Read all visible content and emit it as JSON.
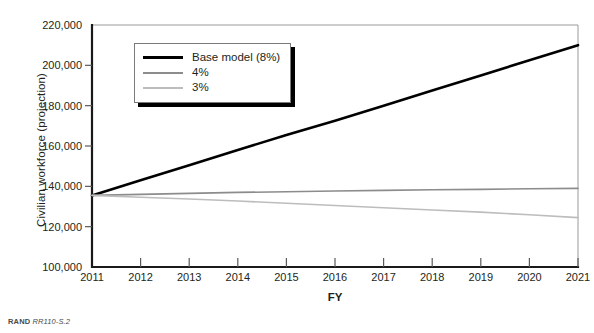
{
  "figure": {
    "source_note_brand": "RAND",
    "source_note_id": "RR110-S.2"
  },
  "chart_data": {
    "type": "line",
    "title": "",
    "xlabel": "FY",
    "ylabel": "Civilian workforce (projection)",
    "x": [
      2011,
      2012,
      2013,
      2014,
      2015,
      2016,
      2017,
      2018,
      2019,
      2020,
      2021
    ],
    "x_tick_labels": [
      "2011",
      "2012",
      "2013",
      "2014",
      "2015",
      "2016",
      "2017",
      "2018",
      "2019",
      "2020",
      "2021"
    ],
    "xlim": [
      2011,
      2021
    ],
    "ylim": [
      100000,
      220000
    ],
    "y_ticks": [
      100000,
      120000,
      140000,
      160000,
      180000,
      200000,
      220000
    ],
    "y_tick_labels": [
      "100,000",
      "120,000",
      "140,000",
      "160,000",
      "180,000",
      "200,000",
      "220,000"
    ],
    "grid": false,
    "legend_position": "upper-left-inside",
    "series": [
      {
        "name": "Base model (8%)",
        "color": "#000000",
        "width": 2.6,
        "values": [
          135500,
          143000,
          150500,
          158000,
          165500,
          172500,
          180000,
          187500,
          195000,
          202500,
          210000
        ]
      },
      {
        "name": "4%",
        "color": "#8c8c8c",
        "width": 1.6,
        "values": [
          135500,
          136000,
          136500,
          137000,
          137300,
          137700,
          138000,
          138300,
          138500,
          138800,
          139000
        ]
      },
      {
        "name": "3%",
        "color": "#bdbdbd",
        "width": 1.6,
        "values": [
          135500,
          134600,
          133700,
          132700,
          131600,
          130500,
          129400,
          128300,
          127200,
          125900,
          124500
        ]
      }
    ]
  }
}
